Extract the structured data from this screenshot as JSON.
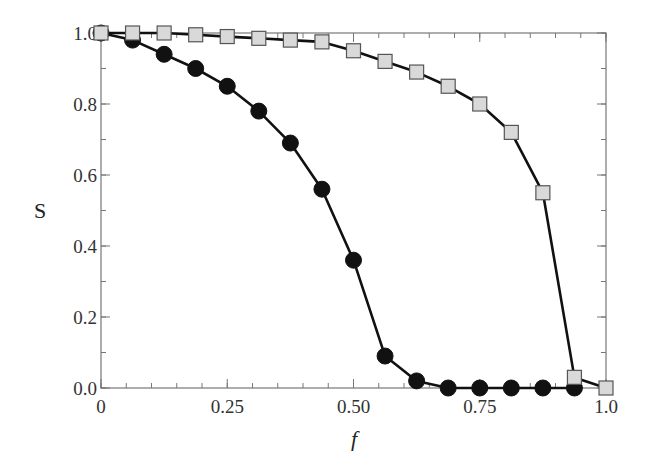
{
  "chart_data": {
    "type": "line",
    "title": "",
    "xlabel": "f",
    "ylabel": "S",
    "xlim": [
      0,
      1.0
    ],
    "ylim": [
      0,
      1.0
    ],
    "grid": false,
    "legend": null,
    "x_ticks": [
      {
        "value": 0,
        "label": "0"
      },
      {
        "value": 0.25,
        "label": "0.25"
      },
      {
        "value": 0.5,
        "label": "0.50"
      },
      {
        "value": 0.75,
        "label": "0.75"
      },
      {
        "value": 1.0,
        "label": "1.0"
      }
    ],
    "x_minor_step": 0.05,
    "y_ticks": [
      {
        "value": 0.0,
        "label": "0.0"
      },
      {
        "value": 0.2,
        "label": "0.2"
      },
      {
        "value": 0.4,
        "label": "0.4"
      },
      {
        "value": 0.6,
        "label": "0.6"
      },
      {
        "value": 0.8,
        "label": "0.8"
      },
      {
        "value": 1.0,
        "label": "1.0"
      }
    ],
    "y_minor_step": 0.1,
    "x": [
      0,
      0.0625,
      0.125,
      0.1875,
      0.25,
      0.3125,
      0.375,
      0.4375,
      0.5,
      0.5625,
      0.625,
      0.6875,
      0.75,
      0.8125,
      0.875,
      0.9375,
      1.0
    ],
    "series": [
      {
        "name": "squares",
        "marker": "square",
        "marker_fill": "#d9d9d9",
        "marker_stroke": "#555555",
        "values": [
          1.0,
          1.0,
          1.0,
          0.995,
          0.99,
          0.985,
          0.98,
          0.975,
          0.95,
          0.92,
          0.89,
          0.85,
          0.8,
          0.72,
          0.55,
          0.03,
          0.0
        ]
      },
      {
        "name": "circles",
        "marker": "circle",
        "marker_fill": "#111111",
        "marker_stroke": "#111111",
        "values": [
          1.0,
          0.98,
          0.94,
          0.9,
          0.85,
          0.78,
          0.69,
          0.56,
          0.36,
          0.09,
          0.02,
          0.0,
          0.0,
          0.0,
          0.0,
          0.0,
          null
        ]
      }
    ]
  }
}
